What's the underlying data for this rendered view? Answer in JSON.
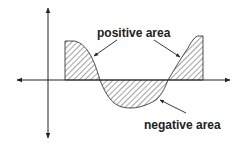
{
  "diagram": {
    "labels": {
      "positive": "positive area",
      "negative": "negative area"
    },
    "colors": {
      "stroke": "#222222",
      "background": "#ffffff"
    }
  }
}
